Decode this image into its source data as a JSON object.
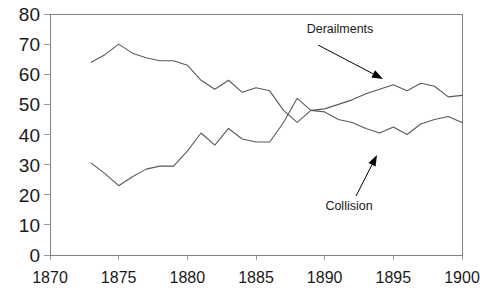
{
  "chart_data": {
    "type": "line",
    "title": "",
    "xlabel": "",
    "ylabel": "",
    "xlim": [
      1870,
      1900
    ],
    "ylim": [
      0,
      80
    ],
    "grid": false,
    "legend": "annotations",
    "x_ticks": [
      "1870",
      "1875",
      "1880",
      "1885",
      "1890",
      "1895",
      "1900"
    ],
    "x_tick_values": [
      1870,
      1875,
      1880,
      1885,
      1890,
      1895,
      1900
    ],
    "y_ticks": [
      "0",
      "10",
      "20",
      "30",
      "40",
      "50",
      "60",
      "70",
      "80"
    ],
    "y_tick_values": [
      0,
      10,
      20,
      30,
      40,
      50,
      60,
      70,
      80
    ],
    "x": [
      1873,
      1874,
      1875,
      1876,
      1877,
      1878,
      1879,
      1880,
      1881,
      1882,
      1883,
      1884,
      1885,
      1886,
      1887,
      1888,
      1889,
      1890,
      1891,
      1892,
      1893,
      1894,
      1895,
      1896,
      1897,
      1898,
      1899,
      1900
    ],
    "series": [
      {
        "name": "Derailments",
        "values": [
          64,
          66.5,
          70,
          67,
          65.5,
          64.5,
          64.5,
          63,
          58,
          55,
          58,
          54,
          55.5,
          54.5,
          48,
          44,
          48,
          48.5,
          50,
          51.5,
          53.5,
          55,
          56.5,
          54.5,
          57,
          56,
          52.5,
          53
        ]
      },
      {
        "name": "Collision",
        "values": [
          30.5,
          27,
          23,
          26,
          28.5,
          29.5,
          29.5,
          34.5,
          40.5,
          36.5,
          42,
          38.5,
          37.5,
          37.5,
          44,
          52,
          48,
          47.5,
          45,
          44,
          42,
          40.5,
          42.5,
          40,
          43.5,
          45,
          46,
          44
        ]
      }
    ],
    "annotations": [
      {
        "name": "derailments-annotation",
        "label": "Derailments",
        "label_x": 340,
        "label_y": 33,
        "leader_x1": 318,
        "leader_y1": 45,
        "leader_x2": 383,
        "leader_y2": 79,
        "points_to": "Derailments series near 1893"
      },
      {
        "name": "collision-annotation",
        "label": "Collision",
        "label_x": 349,
        "label_y": 210,
        "leader_x1": 356,
        "leader_y1": 196,
        "leader_x2": 377,
        "leader_y2": 155,
        "points_to": "Collision series near 1894"
      }
    ]
  },
  "plot": {
    "left": 50,
    "right": 462,
    "top": 14,
    "bottom": 255,
    "border_color": "#7f7f7f",
    "line_color": "#595959",
    "background": "#ffffff"
  }
}
